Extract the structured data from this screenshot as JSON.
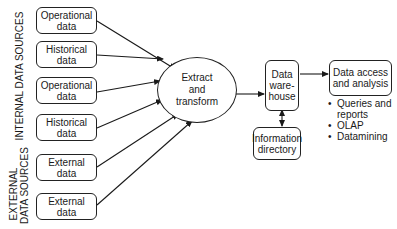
{
  "diagram": {
    "groups": {
      "internal": "INTERNAL DATA SOURCES",
      "external_line1": "EXTERNAL",
      "external_line2": "DATA SOURCES"
    },
    "sources": [
      {
        "line1": "Operational",
        "line2": "data",
        "group": "internal"
      },
      {
        "line1": "Historical",
        "line2": "data",
        "group": "internal"
      },
      {
        "line1": "Operational",
        "line2": "data",
        "group": "internal"
      },
      {
        "line1": "Historical",
        "line2": "data",
        "group": "internal"
      },
      {
        "line1": "External",
        "line2": "data",
        "group": "external"
      },
      {
        "line1": "External",
        "line2": "data",
        "group": "external"
      }
    ],
    "etl": {
      "line1": "Extract",
      "line2": "and",
      "line3": "transform"
    },
    "warehouse": {
      "line1": "Data",
      "line2": "ware-",
      "line3": "house"
    },
    "directory": {
      "line1": "Information",
      "line2": "directory"
    },
    "access": {
      "line1": "Data access",
      "line2": "and analysis"
    },
    "analysis_items": [
      {
        "line1": "Queries and",
        "line2": "reports"
      },
      {
        "line1": "OLAP"
      },
      {
        "line1": "Datamining"
      }
    ],
    "edges": [
      {
        "from": "sources.0",
        "to": "etl"
      },
      {
        "from": "sources.1",
        "to": "etl"
      },
      {
        "from": "sources.2",
        "to": "etl"
      },
      {
        "from": "sources.3",
        "to": "etl"
      },
      {
        "from": "sources.4",
        "to": "etl"
      },
      {
        "from": "sources.5",
        "to": "etl"
      },
      {
        "from": "etl",
        "to": "warehouse"
      },
      {
        "from": "warehouse",
        "to": "directory",
        "bidirectional": true
      },
      {
        "from": "warehouse",
        "to": "access"
      }
    ]
  }
}
